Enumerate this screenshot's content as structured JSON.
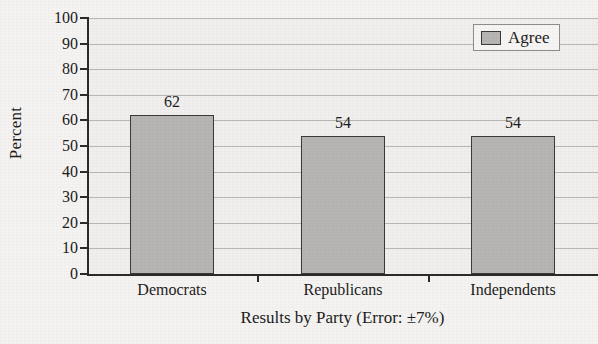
{
  "chart_data": {
    "type": "bar",
    "title": "",
    "categories": [
      "Democrats",
      "Republicans",
      "Independents"
    ],
    "values": [
      62,
      54,
      54
    ],
    "series": [
      {
        "name": "Agree",
        "values": [
          62,
          54,
          54
        ]
      }
    ],
    "xlabel": "Results by Party (Error: ±7%)",
    "ylabel": "Percent",
    "ylim": [
      0,
      100
    ],
    "ytick_step": 10,
    "ytick_labels": [
      "100",
      "90",
      "80",
      "70",
      "60",
      "50",
      "40",
      "30",
      "20",
      "10",
      "0"
    ],
    "ytick_values": [
      100,
      90,
      80,
      70,
      60,
      50,
      40,
      30,
      20,
      10,
      0
    ],
    "data_labels": [
      "62",
      "54",
      "54"
    ],
    "grid": "horizontal",
    "legend": {
      "position": "top-right",
      "entries": [
        {
          "label": "Agree",
          "swatch_name": "legend-swatch-agree"
        }
      ]
    },
    "colors": {
      "bar_fill": "#b6b5b3",
      "bar_border": "#3a3a3a",
      "gridline": "#b8b7b4",
      "axis": "#2b2b2b",
      "plot_background": "#f0efed",
      "page_background": "#f4f3f1",
      "text": "#1c1c1c"
    }
  }
}
